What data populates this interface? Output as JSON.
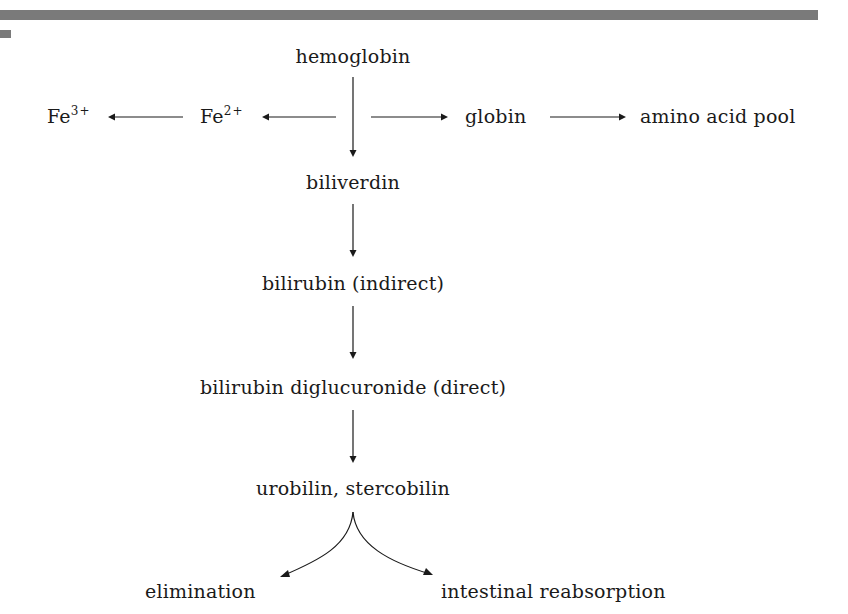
{
  "decor": {
    "top_bar_color": "#7a7a7a",
    "text_color": "#1a1a1a"
  },
  "nodes": {
    "hemoglobin": "hemoglobin",
    "fe3": {
      "base": "Fe",
      "charge": "3+"
    },
    "fe2": {
      "base": "Fe",
      "charge": "2+"
    },
    "globin": "globin",
    "amino_acid_pool": "amino acid pool",
    "biliverdin": "biliverdin",
    "bilirubin_indirect": "bilirubin (indirect)",
    "bilirubin_diglucuronide": "bilirubin diglucuronide (direct)",
    "urobilin_stercobilin": "urobilin, stercobilin",
    "elimination": "elimination",
    "intestinal_reabsorption": "intestinal reabsorption"
  },
  "edges": [
    {
      "from": "hemoglobin",
      "to": "biliverdin"
    },
    {
      "from": "hemoglobin",
      "to": "Fe2+"
    },
    {
      "from": "Fe2+",
      "to": "Fe3+"
    },
    {
      "from": "hemoglobin",
      "to": "globin"
    },
    {
      "from": "globin",
      "to": "amino acid pool"
    },
    {
      "from": "biliverdin",
      "to": "bilirubin (indirect)"
    },
    {
      "from": "bilirubin (indirect)",
      "to": "bilirubin diglucuronide (direct)"
    },
    {
      "from": "bilirubin diglucuronide (direct)",
      "to": "urobilin, stercobilin"
    },
    {
      "from": "urobilin, stercobilin",
      "to": "elimination"
    },
    {
      "from": "urobilin, stercobilin",
      "to": "intestinal reabsorption"
    }
  ]
}
